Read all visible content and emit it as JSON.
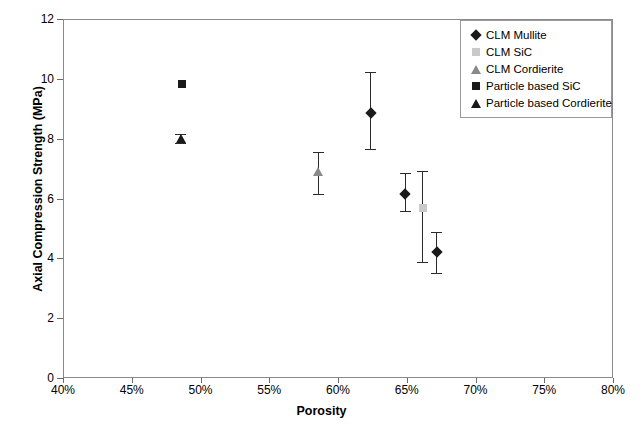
{
  "chart_data": {
    "type": "scatter",
    "title": "",
    "xlabel": "Porosity",
    "ylabel": "Axial Compression Strength (MPa)",
    "xlim": [
      40,
      80
    ],
    "ylim": [
      0,
      12
    ],
    "xticks": [
      "40%",
      "45%",
      "50%",
      "55%",
      "60%",
      "65%",
      "70%",
      "75%",
      "80%"
    ],
    "xtick_values": [
      40,
      45,
      50,
      55,
      60,
      65,
      70,
      75,
      80
    ],
    "yticks": [
      "0",
      "2",
      "4",
      "6",
      "8",
      "10",
      "12"
    ],
    "ytick_values": [
      0,
      2,
      4,
      6,
      8,
      10,
      12
    ],
    "grid": false,
    "legend_position": "top-right",
    "series": [
      {
        "name": "CLM Mullite",
        "marker": "diamond",
        "color": "#1a1a1a",
        "points": [
          {
            "x": 62.3,
            "y": 8.9,
            "yerr_low": 7.7,
            "yerr_high": 10.25
          },
          {
            "x": 64.8,
            "y": 6.2,
            "yerr_low": 5.6,
            "yerr_high": 6.9
          },
          {
            "x": 67.1,
            "y": 4.25,
            "yerr_low": 3.55,
            "yerr_high": 4.9
          }
        ]
      },
      {
        "name": "CLM SiC",
        "marker": "square",
        "color": "#c9c9c9",
        "points": [
          {
            "x": 66.1,
            "y": 5.7,
            "yerr_low": 3.9,
            "yerr_high": 6.95
          }
        ]
      },
      {
        "name": "CLM Cordierite",
        "marker": "triangle",
        "color": "#8a8a8a",
        "points": [
          {
            "x": 58.5,
            "y": 6.95,
            "yerr_low": 6.2,
            "yerr_high": 7.6
          }
        ]
      },
      {
        "name": "Particle based SiC",
        "marker": "square",
        "color": "#1a1a1a",
        "points": [
          {
            "x": 48.6,
            "y": 9.85,
            "yerr_low": 9.85,
            "yerr_high": 9.85
          }
        ]
      },
      {
        "name": "Particle based Cordierite",
        "marker": "triangle",
        "color": "#1a1a1a",
        "points": [
          {
            "x": 48.5,
            "y": 8.05,
            "yerr_low": 7.9,
            "yerr_high": 8.2
          }
        ]
      }
    ]
  },
  "legend": {
    "items": [
      {
        "label": "CLM Mullite",
        "marker": "diamond",
        "color": "#1a1a1a"
      },
      {
        "label": "CLM SiC",
        "marker": "square",
        "color": "#c9c9c9"
      },
      {
        "label": "CLM Cordierite",
        "marker": "triangle",
        "color": "#8a8a8a"
      },
      {
        "label": "Particle based SiC",
        "marker": "square",
        "color": "#1a1a1a"
      },
      {
        "label": "Particle based Cordierite",
        "marker": "triangle",
        "color": "#1a1a1a"
      }
    ]
  },
  "colors": {
    "axis": "#6b6b6b",
    "frame": "#8a8a8a",
    "text": "#000000",
    "background": "#ffffff",
    "error_bar": "#2a2a2a"
  }
}
